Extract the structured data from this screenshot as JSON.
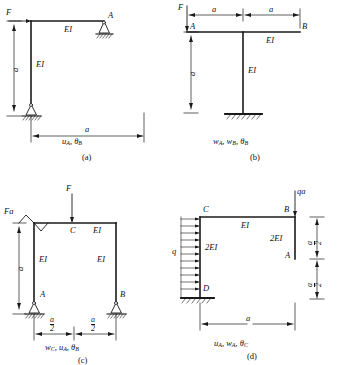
{
  "figure": {
    "kind": "structural-frame-problem-set",
    "panel_count": 4
  },
  "panels": [
    {
      "id": "a",
      "caption": "(a)",
      "result_labels": "u",
      "result_sub1": "A",
      "result_mid": ", θ",
      "result_sub2": "B",
      "loads": [
        {
          "name": "F",
          "label": "F",
          "type": "point-force",
          "direction": "right",
          "location": "top of left column"
        }
      ],
      "members": [
        {
          "label": "EI",
          "name": "top-beam-stiffness"
        },
        {
          "label": "EI",
          "name": "left-column-stiffness"
        }
      ],
      "joints": [
        {
          "label": "A",
          "name": "joint-a-label"
        }
      ],
      "supports": [
        {
          "type": "pin",
          "name": "pin-support-right-top"
        },
        {
          "type": "pin",
          "name": "pin-support-base"
        }
      ],
      "dimensions": [
        {
          "label": "a",
          "name": "vertical-dim-a",
          "orientation": "vertical"
        },
        {
          "label": "a",
          "name": "horizontal-dim-a",
          "orientation": "horizontal"
        }
      ]
    },
    {
      "id": "b",
      "caption": "(b)",
      "result_labels": "w",
      "result_sub1": "A",
      "result_mid": ", w",
      "result_sub2": "B",
      "result_mid2": ", θ",
      "result_sub3": "B",
      "loads": [
        {
          "name": "F",
          "label": "F",
          "type": "point-force",
          "direction": "down",
          "location": "left end A"
        }
      ],
      "members": [
        {
          "label": "EI",
          "name": "top-beam-stiffness"
        },
        {
          "label": "EI",
          "name": "center-column-stiffness"
        }
      ],
      "joints": [
        {
          "label": "A",
          "name": "joint-a-label"
        },
        {
          "label": "B",
          "name": "joint-b-label"
        }
      ],
      "supports": [
        {
          "type": "fixed",
          "name": "fixed-support-base"
        }
      ],
      "dimensions": [
        {
          "label": "a",
          "name": "horizontal-dim-a-left",
          "orientation": "horizontal"
        },
        {
          "label": "a",
          "name": "horizontal-dim-a-right",
          "orientation": "horizontal"
        },
        {
          "label": "a",
          "name": "vertical-dim-a",
          "orientation": "vertical"
        }
      ]
    },
    {
      "id": "c",
      "caption": "(c)",
      "result_labels": "w",
      "result_sub1": "C",
      "result_mid": ", u",
      "result_sub2": "A",
      "result_mid2": ", θ",
      "result_sub3": "B",
      "loads": [
        {
          "name": "Fa",
          "label": "Fa",
          "type": "moment",
          "location": "top-left corner"
        },
        {
          "name": "F",
          "label": "F",
          "type": "point-force",
          "direction": "down",
          "location": "midspan C"
        }
      ],
      "members": [
        {
          "label": "EI",
          "name": "top-beam-stiffness"
        },
        {
          "label": "EI",
          "name": "left-column-stiffness"
        },
        {
          "label": "EI",
          "name": "right-column-stiffness"
        }
      ],
      "joints": [
        {
          "label": "C",
          "name": "joint-c-label"
        },
        {
          "label": "A",
          "name": "joint-a-label"
        },
        {
          "label": "B",
          "name": "joint-b-label"
        }
      ],
      "supports": [
        {
          "type": "pin",
          "name": "pin-support-a"
        },
        {
          "type": "pin",
          "name": "pin-support-b"
        }
      ],
      "dimensions": [
        {
          "num": "a",
          "den": "2",
          "name": "horizontal-dim-half-a-left",
          "orientation": "horizontal"
        },
        {
          "num": "a",
          "den": "2",
          "name": "horizontal-dim-half-a-right",
          "orientation": "horizontal"
        },
        {
          "label": "a",
          "name": "vertical-dim-a",
          "orientation": "vertical"
        }
      ]
    },
    {
      "id": "d",
      "caption": "(d)",
      "result_labels": "u",
      "result_sub1": "A",
      "result_mid": ", w",
      "result_sub2": "A",
      "result_mid2": ", θ",
      "result_sub3": "C",
      "loads": [
        {
          "name": "q",
          "label": "q",
          "type": "distributed",
          "direction": "right",
          "location": "left column CD",
          "arrow_count": 11
        },
        {
          "name": "qa",
          "label": "qa",
          "type": "point-force",
          "direction": "down",
          "location": "joint B"
        }
      ],
      "members": [
        {
          "label": "EI",
          "name": "top-beam-stiffness"
        },
        {
          "label": "2EI",
          "name": "left-column-stiffness"
        },
        {
          "label": "2EI",
          "name": "right-column-stiffness"
        }
      ],
      "joints": [
        {
          "label": "C",
          "name": "joint-c-label"
        },
        {
          "label": "B",
          "name": "joint-b-label"
        },
        {
          "label": "A",
          "name": "joint-a-label"
        },
        {
          "label": "D",
          "name": "joint-d-label"
        }
      ],
      "supports": [
        {
          "type": "fixed",
          "name": "fixed-support-d"
        }
      ],
      "dimensions": [
        {
          "label": "a",
          "name": "horizontal-dim-a",
          "orientation": "horizontal"
        },
        {
          "num": "a",
          "den": "2",
          "name": "vertical-dim-half-a-upper",
          "orientation": "vertical"
        },
        {
          "num": "a",
          "den": "2",
          "name": "vertical-dim-half-a-lower",
          "orientation": "vertical"
        }
      ]
    }
  ],
  "colors": {
    "line": "#1a1a1a",
    "background": "#ffffff",
    "dimension": "#2a2a2a"
  }
}
